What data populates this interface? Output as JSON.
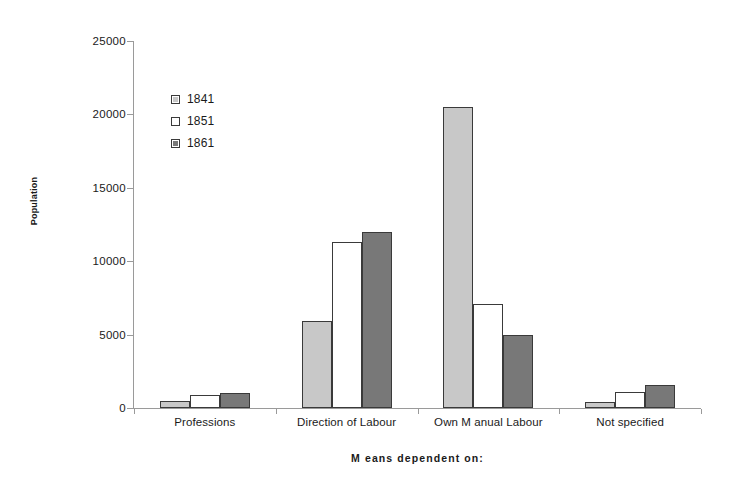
{
  "chart_data": {
    "type": "bar",
    "title": "",
    "xlabel": "M eans dependent on:",
    "ylabel": "Population",
    "categories": [
      "Professions",
      "Direction of Labour",
      "Own M anual Labour",
      "Not specified"
    ],
    "series": [
      {
        "name": "1841",
        "color": "#c8c8c8",
        "values": [
          500,
          5900,
          20500,
          400
        ]
      },
      {
        "name": "1851",
        "color": "#ffffff",
        "values": [
          900,
          11300,
          7100,
          1100
        ]
      },
      {
        "name": "1861",
        "color": "#787878",
        "values": [
          1050,
          12000,
          5000,
          1600
        ]
      }
    ],
    "ylim": [
      0,
      25000
    ],
    "ytick_values": [
      0,
      5000,
      10000,
      15000,
      20000,
      25000
    ],
    "ytick_labels": [
      "0",
      "5000",
      "10000",
      "15000",
      "20000",
      "25000"
    ],
    "grid": false,
    "legend_position": "upper-left-inside",
    "bar_border_color": "#3a3a3a",
    "axis_color": "#9a9a9a"
  }
}
